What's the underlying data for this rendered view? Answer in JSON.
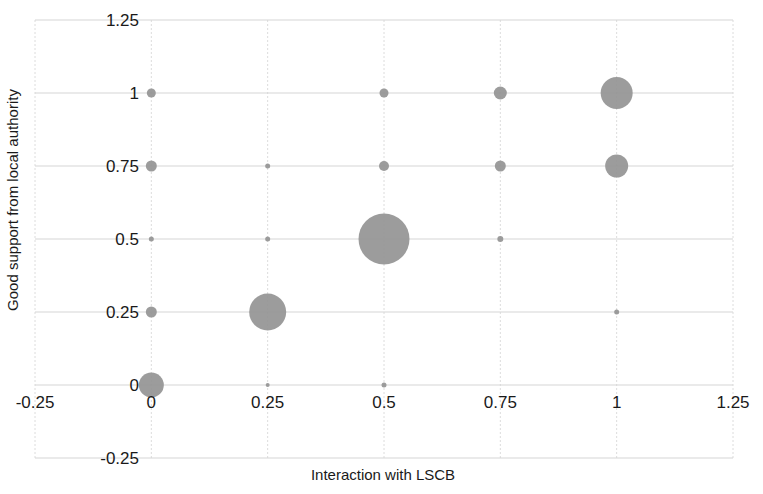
{
  "chart_data": {
    "type": "scatter",
    "title": "",
    "xlabel": "Interaction with LSCB",
    "ylabel": "Good support from local authority",
    "xlim": [
      -0.25,
      1.25
    ],
    "ylim": [
      -0.25,
      1.25
    ],
    "xticks": [
      "-0.25",
      "0",
      "0.25",
      "0.5",
      "0.75",
      "1",
      "1.25"
    ],
    "yticks": [
      "-0.25",
      "0",
      "0.25",
      "0.5",
      "0.75",
      "1",
      "1.25"
    ],
    "xtick_values": [
      -0.25,
      0,
      0.25,
      0.5,
      0.75,
      1,
      1.25
    ],
    "ytick_values": [
      -0.25,
      0,
      0.25,
      0.5,
      0.75,
      1,
      1.25
    ],
    "grid": true,
    "legend": "none",
    "marker_color": "#949494",
    "size_encodes": "count",
    "points": [
      {
        "x": 0,
        "y": 1,
        "size": 9
      },
      {
        "x": 0,
        "y": 0.75,
        "size": 11
      },
      {
        "x": 0,
        "y": 0.5,
        "size": 5
      },
      {
        "x": 0,
        "y": 0.25,
        "size": 11
      },
      {
        "x": 0,
        "y": 0,
        "size": 25
      },
      {
        "x": 0.25,
        "y": 0.75,
        "size": 5
      },
      {
        "x": 0.25,
        "y": 0.5,
        "size": 5
      },
      {
        "x": 0.25,
        "y": 0.25,
        "size": 37
      },
      {
        "x": 0.25,
        "y": 0,
        "size": 4
      },
      {
        "x": 0.5,
        "y": 1,
        "size": 9
      },
      {
        "x": 0.5,
        "y": 0.75,
        "size": 10
      },
      {
        "x": 0.5,
        "y": 0.5,
        "size": 51
      },
      {
        "x": 0.5,
        "y": 0,
        "size": 5
      },
      {
        "x": 0.75,
        "y": 1,
        "size": 13
      },
      {
        "x": 0.75,
        "y": 0.75,
        "size": 11
      },
      {
        "x": 0.75,
        "y": 0.5,
        "size": 6
      },
      {
        "x": 1,
        "y": 1,
        "size": 32
      },
      {
        "x": 1,
        "y": 0.75,
        "size": 23
      },
      {
        "x": 1,
        "y": 0.25,
        "size": 5
      }
    ]
  },
  "axes": {
    "x_title": "Interaction with LSCB",
    "y_title": "Good support from local authority"
  }
}
